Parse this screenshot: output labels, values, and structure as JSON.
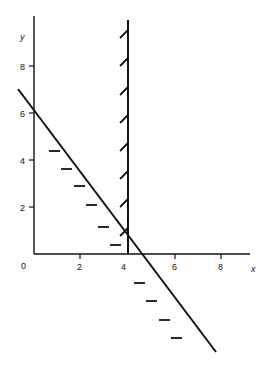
{
  "diagram": {
    "type": "linear-inequality-graph",
    "axes": {
      "x_label": "x",
      "y_label": "y",
      "origin_label": "0",
      "x_ticks": [
        "2",
        "4",
        "6",
        "8"
      ],
      "y_ticks": [
        "2",
        "4",
        "6",
        "8"
      ]
    },
    "lines": [
      {
        "name": "vertical-boundary",
        "equation": "x = 4",
        "hatch_side": "left"
      },
      {
        "name": "diagonal-boundary",
        "equation": "3x + 2y = 12",
        "from": [
          0,
          6
        ],
        "to": [
          4,
          0
        ],
        "hatch_side": "below-left"
      }
    ],
    "colors": {
      "ink": "#111111",
      "background": "#ffffff"
    }
  }
}
